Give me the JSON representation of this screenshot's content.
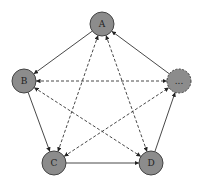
{
  "diagram": {
    "type": "directed-graph",
    "nodes": [
      {
        "id": "A",
        "label": "A",
        "x": 102,
        "y": 24,
        "style": "solid"
      },
      {
        "id": "B",
        "label": "B",
        "x": 24,
        "y": 81,
        "style": "solid"
      },
      {
        "id": "E",
        "label": "...",
        "x": 179,
        "y": 81,
        "style": "dashed"
      },
      {
        "id": "C",
        "label": "C",
        "x": 54,
        "y": 163,
        "style": "solid"
      },
      {
        "id": "D",
        "label": "D",
        "x": 151,
        "y": 163,
        "style": "solid"
      }
    ],
    "edges": [
      {
        "from": "A",
        "to": "B",
        "style": "solid",
        "bidirectional": false
      },
      {
        "from": "B",
        "to": "C",
        "style": "solid",
        "bidirectional": false
      },
      {
        "from": "C",
        "to": "D",
        "style": "solid",
        "bidirectional": false
      },
      {
        "from": "D",
        "to": "E",
        "style": "solid",
        "bidirectional": false
      },
      {
        "from": "E",
        "to": "A",
        "style": "solid",
        "bidirectional": false
      },
      {
        "from": "B",
        "to": "E",
        "style": "dashed",
        "bidirectional": true
      },
      {
        "from": "A",
        "to": "C",
        "style": "dashed",
        "bidirectional": true
      },
      {
        "from": "A",
        "to": "D",
        "style": "dashed",
        "bidirectional": true
      },
      {
        "from": "B",
        "to": "D",
        "style": "dashed",
        "bidirectional": true
      },
      {
        "from": "C",
        "to": "E",
        "style": "dashed",
        "bidirectional": true
      }
    ],
    "colors": {
      "node_fill": "#8c8c8c",
      "stroke": "#333333",
      "background": "#ffffff"
    }
  }
}
